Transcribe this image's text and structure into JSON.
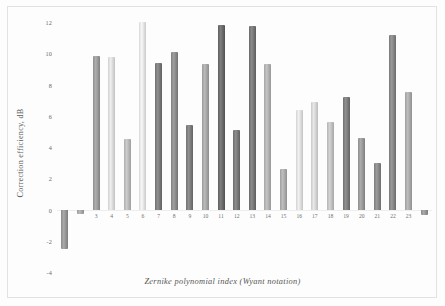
{
  "chart_data": {
    "type": "bar",
    "title": "",
    "xlabel": "Zernike polynomial index (Wyant notation)",
    "ylabel": "Correction efficiency, dB",
    "categories": [
      "1",
      "2",
      "3",
      "4",
      "5",
      "6",
      "7",
      "8",
      "9",
      "10",
      "11",
      "12",
      "13",
      "14",
      "15",
      "16",
      "17",
      "18",
      "19",
      "20",
      "21",
      "22",
      "23",
      "24"
    ],
    "values": [
      -2.5,
      -0.3,
      9.8,
      9.75,
      4.5,
      12.0,
      9.4,
      10.1,
      5.4,
      9.3,
      11.8,
      5.1,
      11.75,
      9.3,
      2.6,
      6.4,
      6.9,
      5.6,
      7.2,
      4.6,
      3.0,
      11.2,
      7.5,
      -0.35
    ],
    "xtick_labels_shown": [
      "3",
      "4",
      "5",
      "6",
      "7",
      "8",
      "9",
      "10",
      "11",
      "12",
      "13",
      "14",
      "15",
      "16",
      "17",
      "18",
      "19",
      "20",
      "21",
      "22",
      "23"
    ],
    "ytick_labels": [
      "12",
      "10",
      "8",
      "6",
      "4",
      "2",
      "0",
      "-2",
      "-4"
    ],
    "ytick_values": [
      12,
      10,
      8,
      6,
      4,
      2,
      0,
      -2,
      -4
    ],
    "ylim": [
      -4,
      12
    ],
    "grid": false,
    "legend": "none",
    "bar_colors": [
      "#8a8a8a",
      "#9a9a9a",
      "#8f8f8f",
      "#cfcfcf",
      "#adadad",
      "#d8d8d8",
      "#6f6f6f",
      "#808080",
      "#717171",
      "#9b9b9b",
      "#5f5f5f",
      "#6d6d6d",
      "#6b6b6b",
      "#a5a5a5",
      "#9f9f9f",
      "#d2d2d2",
      "#c9c9c9",
      "#b4b4b4",
      "#707070",
      "#8d8d8d",
      "#7c7c7c",
      "#7a7a7a",
      "#9e9e9e",
      "#8a8a8a"
    ]
  }
}
